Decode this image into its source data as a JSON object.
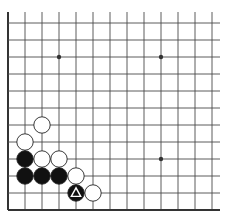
{
  "board": {
    "title": "Go board diagram (lower-left corner)",
    "colors": {
      "background": "#ffffff",
      "line": "#4a4a4a",
      "edge": "#333333",
      "black_stone": "#111111",
      "white_stone": "#ffffff",
      "stone_outline": "#222222",
      "marker_on_black": "#ffffff"
    },
    "geometry": {
      "origin_x": 8,
      "bottom_y": 210,
      "spacing": 17,
      "columns": 13,
      "rows": 12,
      "top_line_start_y": 12,
      "right_line_end_x": 220,
      "stone_radius": 8.2
    },
    "star_points": [
      {
        "col": 3,
        "row": 9
      },
      {
        "col": 9,
        "row": 9
      },
      {
        "col": 9,
        "row": 3
      }
    ],
    "stones": [
      {
        "color": "white",
        "col": 2,
        "row": 5
      },
      {
        "color": "white",
        "col": 1,
        "row": 4
      },
      {
        "color": "black",
        "col": 1,
        "row": 3
      },
      {
        "color": "white",
        "col": 2,
        "row": 3
      },
      {
        "color": "white",
        "col": 3,
        "row": 3
      },
      {
        "color": "black",
        "col": 1,
        "row": 2
      },
      {
        "color": "black",
        "col": 2,
        "row": 2
      },
      {
        "color": "black",
        "col": 3,
        "row": 2
      },
      {
        "color": "white",
        "col": 4,
        "row": 2
      },
      {
        "color": "black",
        "col": 4,
        "row": 1,
        "marker": "triangle"
      },
      {
        "color": "white",
        "col": 5,
        "row": 1
      }
    ]
  }
}
